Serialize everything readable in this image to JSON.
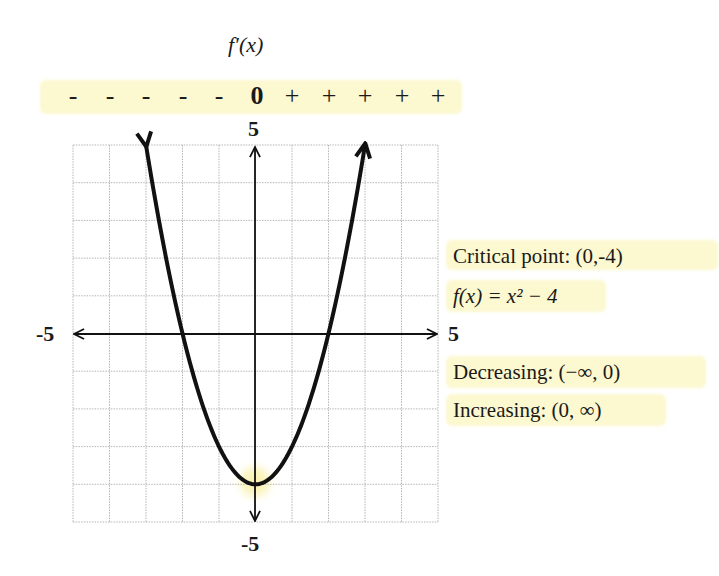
{
  "derivative_label": "f′(x)",
  "sign_chart": {
    "signs": [
      "-",
      "-",
      "-",
      "-",
      "-",
      "0",
      "+",
      "+",
      "+",
      "+",
      "+"
    ],
    "positions_x": [
      -5,
      -4,
      -3,
      -2,
      -1,
      0,
      1,
      2,
      3,
      4,
      5
    ]
  },
  "axes": {
    "y_max_label": "5",
    "y_min_label": "-5",
    "x_min_label": "-5",
    "x_max_label": "5"
  },
  "info": {
    "critical_point": "Critical point: (0,-4)",
    "function": "f(x) = x² − 4",
    "decreasing": "Decreasing: (−∞, 0)",
    "increasing": "Increasing: (0, ∞)"
  },
  "colors": {
    "highlight": "#fcf8cf",
    "curve": "#111111",
    "grid": "#b5b5b5"
  },
  "chart_data": {
    "type": "line",
    "function": "x^2 - 4",
    "x": [
      -3,
      -2.5,
      -2,
      -1.5,
      -1,
      -0.5,
      0,
      0.5,
      1,
      1.5,
      2,
      2.5,
      3
    ],
    "y": [
      5,
      2.25,
      0,
      -1.75,
      -3,
      -3.75,
      -4,
      -3.75,
      -3,
      -1.75,
      0,
      2.25,
      5
    ],
    "xlim": [
      -5,
      5
    ],
    "ylim": [
      -5,
      5
    ],
    "grid": true,
    "grid_step": 1,
    "xlabel": "",
    "ylabel": "",
    "tick_labels": {
      "x": [
        "-5",
        "5"
      ],
      "y": [
        "-5",
        "5"
      ]
    },
    "critical_point": [
      0,
      -4
    ],
    "annotations": [
      "Critical point: (0,-4)",
      "f(x) = x^2 - 4",
      "Decreasing: (-inf, 0)",
      "Increasing: (0, inf)"
    ],
    "derivative_sign_chart": {
      "label": "f'(x)",
      "x": [
        -5,
        -4,
        -3,
        -2,
        -1,
        0,
        1,
        2,
        3,
        4,
        5
      ],
      "signs": [
        "-",
        "-",
        "-",
        "-",
        "-",
        "0",
        "+",
        "+",
        "+",
        "+",
        "+"
      ]
    }
  }
}
